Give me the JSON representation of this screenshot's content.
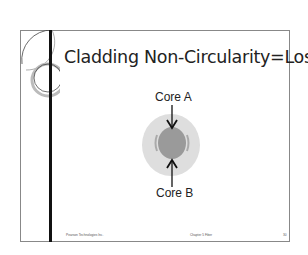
{
  "slide": {
    "title": "Cladding Non-Circularity=Loss",
    "labels": {
      "core_a": "Core A",
      "core_b": "Core B"
    },
    "footer": {
      "left": "Pearson Technologies Inc.",
      "center": "Chapter 5 Fiber",
      "right": "30"
    },
    "colors": {
      "cladding": "#dedede",
      "core": "#9a9a9a",
      "border": "#888888",
      "bar": "#111111"
    }
  }
}
